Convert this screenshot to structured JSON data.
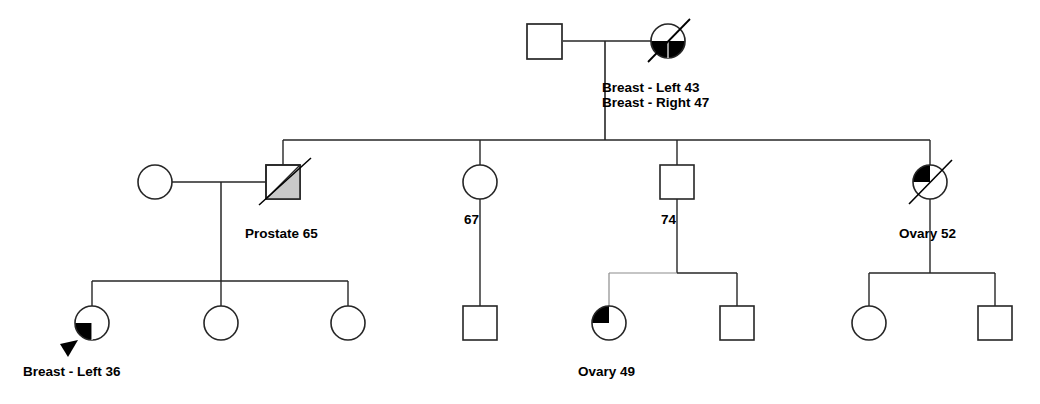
{
  "chart_type": "pedigree",
  "title": "",
  "colors": {
    "line": "#262626",
    "fill_affected": "#000000",
    "fill_unaffected": "#ffffff",
    "shade_gray": "#c9c9c9",
    "background": "#ffffff",
    "text": "#000000"
  },
  "legend_keys": {
    "square": "male",
    "circle": "female",
    "slash": "deceased",
    "arrow": "proband",
    "filled_quadrant": "affected"
  },
  "generations": [
    {
      "id": "gen-1",
      "members": [
        {
          "id": "g1-father",
          "shape": "square",
          "sex": "male",
          "affected": false,
          "deceased": false,
          "proband": false,
          "label": "",
          "cx": 545,
          "cy": 41
        },
        {
          "id": "g1-mother",
          "shape": "circle",
          "sex": "female",
          "affected": true,
          "fill_pattern": "bottom-half",
          "deceased": true,
          "proband": false,
          "label": "Breast - Left 43\nBreast - Right 47",
          "label_line1": "Breast - Left 43",
          "label_line2": "Breast - Right 47",
          "cx": 668,
          "cy": 41
        }
      ]
    },
    {
      "id": "gen-2",
      "members": [
        {
          "id": "g2-spouse-female",
          "shape": "circle",
          "sex": "female",
          "affected": false,
          "deceased": false,
          "proband": false,
          "label": "",
          "cx": 155,
          "cy": 182
        },
        {
          "id": "g2-prostate",
          "shape": "square",
          "sex": "male",
          "affected": true,
          "fill_pattern": "diagonal-gray",
          "deceased": true,
          "proband": false,
          "label": "Prostate 65",
          "cx": 283,
          "cy": 182
        },
        {
          "id": "g2-sister-67",
          "shape": "circle",
          "sex": "female",
          "affected": false,
          "deceased": false,
          "proband": false,
          "label": "67",
          "cx": 480,
          "cy": 182
        },
        {
          "id": "g2-brother-74",
          "shape": "square",
          "sex": "male",
          "affected": false,
          "deceased": false,
          "proband": false,
          "label": "74",
          "cx": 677,
          "cy": 182
        },
        {
          "id": "g2-ovary-52",
          "shape": "circle",
          "sex": "female",
          "affected": true,
          "fill_pattern": "upper-left-quadrant",
          "deceased": true,
          "proband": false,
          "label": "Ovary 52",
          "cx": 930,
          "cy": 182
        }
      ]
    },
    {
      "id": "gen-3",
      "members": [
        {
          "id": "g3-breast-36",
          "shape": "circle",
          "sex": "female",
          "affected": true,
          "fill_pattern": "lower-left-quadrant",
          "deceased": false,
          "proband": true,
          "label": "Breast - Left 36",
          "cx": 92,
          "cy": 323
        },
        {
          "id": "g3-child-2",
          "shape": "circle",
          "sex": "female",
          "affected": false,
          "deceased": false,
          "proband": false,
          "label": "",
          "cx": 221,
          "cy": 323
        },
        {
          "id": "g3-child-3",
          "shape": "circle",
          "sex": "female",
          "affected": false,
          "deceased": false,
          "proband": false,
          "label": "",
          "cx": 348,
          "cy": 323
        },
        {
          "id": "g3-child-4",
          "shape": "square",
          "sex": "male",
          "affected": false,
          "deceased": false,
          "proband": false,
          "label": "",
          "cx": 480,
          "cy": 323
        },
        {
          "id": "g3-ovary-49",
          "shape": "circle",
          "sex": "female",
          "affected": true,
          "fill_pattern": "upper-left-quadrant",
          "deceased": false,
          "proband": false,
          "label": "Ovary 49",
          "cx": 609,
          "cy": 323
        },
        {
          "id": "g3-child-6",
          "shape": "square",
          "sex": "male",
          "affected": false,
          "deceased": false,
          "proband": false,
          "label": "",
          "cx": 737,
          "cy": 323
        },
        {
          "id": "g3-child-7",
          "shape": "circle",
          "sex": "female",
          "affected": false,
          "deceased": false,
          "proband": false,
          "label": "",
          "cx": 869,
          "cy": 323
        },
        {
          "id": "g3-child-8",
          "shape": "square",
          "sex": "male",
          "affected": false,
          "deceased": false,
          "proband": false,
          "label": "",
          "cx": 995,
          "cy": 323
        }
      ]
    }
  ],
  "labels": {
    "gen1_mother_line1": "Breast - Left 43",
    "gen1_mother_line2": "Breast - Right 47",
    "gen2_prostate": "Prostate 65",
    "gen2_age_67": "67",
    "gen2_age_74": "74",
    "gen2_ovary_52": "Ovary 52",
    "gen3_breast_36": "Breast - Left 36",
    "gen3_ovary_49": "Ovary 49"
  }
}
